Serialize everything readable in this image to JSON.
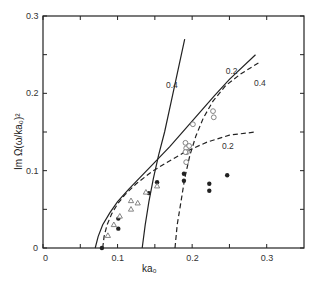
{
  "chart_data": {
    "type": "scatter",
    "title": "",
    "xlabel": "ka₀",
    "ylabel": "Im Ω(ω/ka₀)²",
    "xlim": [
      0,
      0.35
    ],
    "ylim": [
      0,
      0.3
    ],
    "grid": false,
    "x_ticks": [
      {
        "value": 0,
        "label": "0"
      },
      {
        "value": 0.05,
        "label": ""
      },
      {
        "value": 0.1,
        "label": "0.1"
      },
      {
        "value": 0.15,
        "label": ""
      },
      {
        "value": 0.2,
        "label": "0.2"
      },
      {
        "value": 0.25,
        "label": ""
      },
      {
        "value": 0.3,
        "label": "0.3"
      }
    ],
    "y_ticks": [
      {
        "value": 0,
        "label": "0"
      },
      {
        "value": 0.05,
        "label": ""
      },
      {
        "value": 0.1,
        "label": "0.1"
      },
      {
        "value": 0.15,
        "label": ""
      },
      {
        "value": 0.2,
        "label": "0.2"
      },
      {
        "value": 0.25,
        "label": ""
      },
      {
        "value": 0.3,
        "label": "0.3"
      }
    ],
    "series": [
      {
        "name": "theory solid 0.4",
        "style": "solid",
        "label": "0.4",
        "label_pos": [
          0.165,
          0.207
        ],
        "x": [
          0.133,
          0.137,
          0.142,
          0.148,
          0.155,
          0.163,
          0.172,
          0.181,
          0.19
        ],
        "y": [
          0.0,
          0.03,
          0.06,
          0.09,
          0.12,
          0.15,
          0.19,
          0.23,
          0.27
        ]
      },
      {
        "name": "theory solid 0.2",
        "style": "solid",
        "label": "0.2",
        "label_pos": [
          0.245,
          0.225
        ],
        "x": [
          0.07,
          0.074,
          0.08,
          0.09,
          0.1,
          0.115,
          0.13,
          0.15,
          0.17,
          0.19,
          0.21,
          0.23,
          0.25,
          0.285
        ],
        "y": [
          0.0,
          0.015,
          0.03,
          0.046,
          0.06,
          0.076,
          0.091,
          0.111,
          0.131,
          0.153,
          0.175,
          0.197,
          0.218,
          0.25
        ]
      },
      {
        "name": "theory dashed 0.4",
        "style": "dashed",
        "label": "0.4",
        "label_pos": [
          0.283,
          0.21
        ],
        "x": [
          0.177,
          0.18,
          0.185,
          0.19,
          0.197,
          0.205,
          0.215,
          0.228,
          0.245,
          0.265,
          0.29
        ],
        "y": [
          0.0,
          0.03,
          0.06,
          0.09,
          0.12,
          0.145,
          0.168,
          0.19,
          0.21,
          0.225,
          0.24
        ]
      },
      {
        "name": "theory dashed 0.2",
        "style": "dashed",
        "label": "0.2",
        "label_pos": [
          0.24,
          0.128
        ],
        "x": [
          0.08,
          0.082,
          0.086,
          0.092,
          0.1,
          0.11,
          0.125,
          0.145,
          0.165,
          0.19,
          0.22,
          0.25,
          0.285
        ],
        "y": [
          0.0,
          0.015,
          0.03,
          0.044,
          0.057,
          0.069,
          0.083,
          0.098,
          0.11,
          0.124,
          0.137,
          0.146,
          0.15
        ]
      },
      {
        "name": "filled circles",
        "marker": "filled-circle",
        "x": [
          0.079,
          0.101,
          0.101,
          0.142,
          0.153,
          0.189,
          0.189,
          0.223,
          0.223,
          0.247
        ],
        "y": [
          0.0,
          0.038,
          0.025,
          0.071,
          0.085,
          0.096,
          0.087,
          0.083,
          0.074,
          0.094
        ]
      },
      {
        "name": "open triangles",
        "marker": "open-triangle",
        "x": [
          0.087,
          0.095,
          0.103,
          0.118,
          0.118,
          0.127,
          0.138,
          0.153
        ],
        "y": [
          0.016,
          0.03,
          0.041,
          0.061,
          0.05,
          0.058,
          0.072,
          0.08
        ]
      },
      {
        "name": "open circles",
        "marker": "open-circle",
        "x": [
          0.201,
          0.191,
          0.192,
          0.193,
          0.196,
          0.191,
          0.192,
          0.228,
          0.229
        ],
        "y": [
          0.16,
          0.136,
          0.129,
          0.124,
          0.132,
          0.124,
          0.111,
          0.177,
          0.169
        ]
      }
    ]
  },
  "colors": {
    "ink": "#222222",
    "marker_outline": "#777777"
  }
}
